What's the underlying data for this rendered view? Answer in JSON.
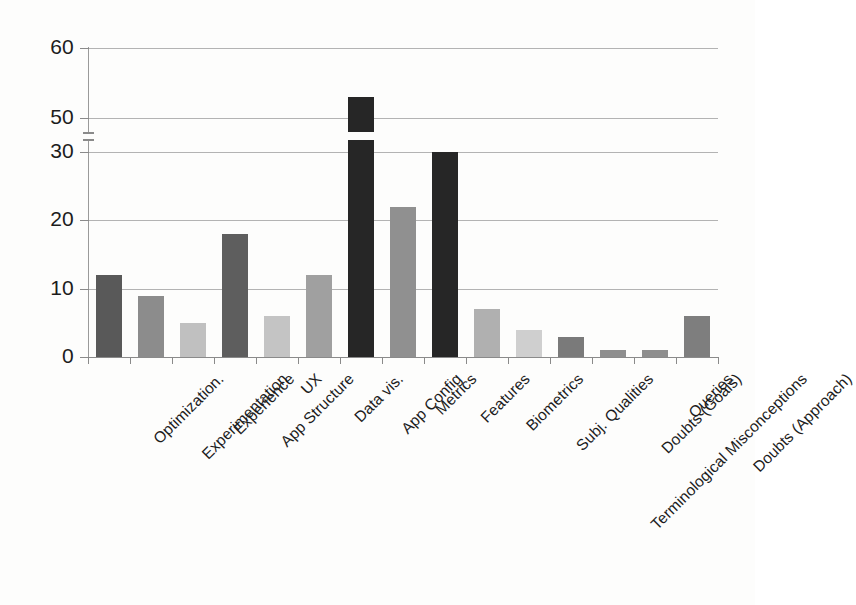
{
  "chart_data": {
    "type": "bar",
    "title": "",
    "subtitle": "",
    "xlabel": "",
    "ylabel": "",
    "grid": true,
    "legend": "none",
    "orientation": "vertical",
    "axis_break": {
      "present": true,
      "between": [
        30,
        50
      ],
      "note": "y-axis is broken between 30 and 50"
    },
    "ylim": [
      0,
      60
    ],
    "ytick_labels": [
      "0",
      "10",
      "20",
      "30",
      "50",
      "60"
    ],
    "ytick_values": [
      0,
      10,
      20,
      30,
      50,
      60
    ],
    "categories": [
      "Optimization.",
      "Experimentation",
      "Experience",
      "App Structure",
      "UX",
      "Data vis.",
      "App Config",
      "Metrics",
      "Features",
      "Biometrics",
      "Subj. Qualities",
      "Terminological Misconceptions",
      "Doubts (Goals)",
      "Queries",
      "Doubts (Approach)"
    ],
    "values": [
      12,
      9,
      5,
      18,
      6,
      12,
      53,
      22,
      30,
      7,
      4,
      3,
      1,
      1,
      6
    ],
    "bar_colors": [
      "#595959",
      "#8c8c8c",
      "#c0c0c0",
      "#5e5e5e",
      "#c4c4c4",
      "#a0a0a0",
      "#262626",
      "#909090",
      "#262626",
      "#b0b0b0",
      "#cfcfcf",
      "#7a7a7a",
      "#8e8e8e",
      "#8e8e8e",
      "#7e7e7e"
    ]
  },
  "axis": {
    "grid_color": "#b3b3b3",
    "axis_color": "#8a8a8a",
    "text_color": "#1c1c1c",
    "background": "#ffffff"
  }
}
